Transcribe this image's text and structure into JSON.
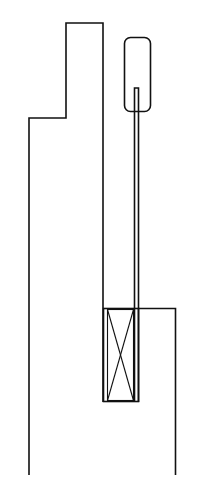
{
  "diagram": {
    "type": "mechanical line drawing",
    "colors": {
      "line": "#111111",
      "background": "#ffffff"
    },
    "parts": [
      {
        "name": "stepped-housing",
        "description": "Stepped outer wall outline on the left, open at the bottom"
      },
      {
        "name": "capsule",
        "description": "Rounded-rectangle capsule at top right"
      },
      {
        "name": "rod",
        "description": "Double-line rod extending from inside capsule down to the lower box"
      },
      {
        "name": "crossed-box",
        "description": "Rectangle with X cross (element) at lower middle"
      },
      {
        "name": "right-wall",
        "description": "Right wall stepping from box top down to bottom"
      }
    ]
  }
}
